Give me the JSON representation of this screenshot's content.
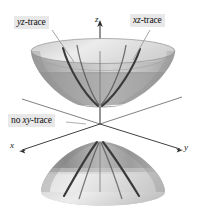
{
  "figure": {
    "background_color": "#ffffff",
    "width": 208,
    "height": 223
  },
  "axes": {
    "z": {
      "label": "z",
      "direction": "up"
    },
    "x": {
      "label": "x",
      "direction": "down-left"
    },
    "y": {
      "label": "y",
      "direction": "down-right"
    },
    "color": "#2b2b2b",
    "origin": {
      "x": 100,
      "y": 124
    }
  },
  "callouts": [
    {
      "id": "yz-trace",
      "text": "yz-trace",
      "italic_part": "yz",
      "plain_part": "-trace",
      "background_color": "#e8e8e8",
      "leader_to": {
        "x": 74,
        "y": 62
      }
    },
    {
      "id": "xz-trace",
      "text": "xz-trace",
      "italic_part": "xz",
      "plain_part": "-trace",
      "background_color": "#e8e8e8",
      "leader_to": {
        "x": 133,
        "y": 60
      }
    },
    {
      "id": "no-xy-trace",
      "text": "no xy-trace",
      "prefix": "no ",
      "italic_part": "xy",
      "plain_part": "-trace",
      "background_color": "#e8e8e8",
      "leader_to": {
        "x": 84,
        "y": 124
      }
    }
  ],
  "surface": {
    "type": "hyperboloid-of-two-sheets",
    "upper_sheet": {
      "rim_center": {
        "x": 103,
        "y": 51
      },
      "rim_rx": 72,
      "rim_ry": 13,
      "vertex": {
        "x": 100,
        "y": 106
      },
      "fill_light": "#d8d8d8",
      "fill_mid": "#bdbdbd",
      "fill_dark": "#8a8a8a",
      "trace_color": "#3a3a3a"
    },
    "lower_sheet": {
      "rim_center": {
        "x": 103,
        "y": 192
      },
      "rim_rx": 62,
      "rim_ry": 13,
      "vertex": {
        "x": 100,
        "y": 142
      },
      "fill_light": "#dedede",
      "fill_mid": "#c4c4c4",
      "fill_dark": "#9a9a9a",
      "trace_color": "#3a3a3a"
    },
    "trace_count": 2
  }
}
